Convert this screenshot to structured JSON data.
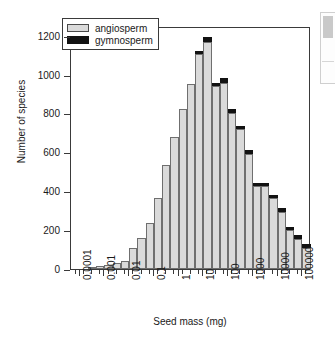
{
  "figure": {
    "background_color": "#ffffff",
    "axis_color": "#3a3a3a"
  },
  "legend": {
    "position": "top-left-inside",
    "entries": [
      {
        "label": "angiosperm",
        "color": "#dadada",
        "swatch": "angiosperm-swatch"
      },
      {
        "label": "gymnosperm",
        "color": "#121212",
        "swatch": "gymnosperm-swatch"
      }
    ]
  },
  "side_panel_fragment": {
    "visible": true
  },
  "chart_data": {
    "type": "bar",
    "subtype": "stacked-histogram",
    "title": "",
    "subtitle": "",
    "xlabel": "Seed mass (mg)",
    "ylabel": "Number of species",
    "xscale": "log",
    "yscale": "linear",
    "ylim": [
      0,
      1250
    ],
    "xlim_log10": [
      -4.35,
      5.35
    ],
    "grid": false,
    "yticks": [
      0,
      200,
      400,
      600,
      800,
      1000,
      1200
    ],
    "ytick_labels": [
      "0",
      "200",
      "400",
      "600",
      "800",
      "1000",
      "1200"
    ],
    "xticks_log10": [
      -4,
      -3,
      -2,
      -1,
      0,
      1,
      2,
      3,
      4,
      5
    ],
    "xtick_labels": [
      "0.0001",
      "0.001",
      "0.01",
      "0.1",
      "1",
      "10",
      "100",
      "1000",
      "10000",
      "100000"
    ],
    "xtick_label_rotation": -90,
    "bin_width_log10": 0.3333,
    "bin_centers_log10": [
      -3.5,
      -3.17,
      -2.83,
      -2.5,
      -2.17,
      -1.83,
      -1.5,
      -1.17,
      -0.83,
      -0.5,
      -0.17,
      0.17,
      0.5,
      0.83,
      1.17,
      1.5,
      1.83,
      2.17,
      2.5,
      2.83,
      3.17,
      3.5,
      3.83,
      4.17,
      4.5,
      4.83,
      5.17
    ],
    "categories": [
      "3e-4",
      "7e-4",
      "1.5e-3",
      "3e-3",
      "7e-3",
      "1.5e-2",
      "3e-2",
      "7e-2",
      "0.15",
      "0.3",
      "0.7",
      "1.5",
      "3",
      "7",
      "15",
      "30",
      "70",
      "150",
      "300",
      "700",
      "1500",
      "3000",
      "7000",
      "15000",
      "30000",
      "70000",
      "150000"
    ],
    "series": [
      {
        "name": "angiosperm",
        "color": "#dadada",
        "values": [
          8,
          14,
          22,
          30,
          42,
          110,
          160,
          235,
          365,
          535,
          680,
          825,
          950,
          1105,
          1170,
          940,
          955,
          805,
          720,
          590,
          425,
          425,
          365,
          295,
          200,
          155,
          110
        ]
      },
      {
        "name": "gymnosperm",
        "color": "#121212",
        "values": [
          0,
          0,
          0,
          0,
          0,
          0,
          0,
          0,
          0,
          0,
          0,
          0,
          0,
          10,
          25,
          10,
          30,
          20,
          15,
          20,
          10,
          10,
          15,
          15,
          10,
          10,
          8
        ]
      }
    ],
    "totals": [
      8,
      14,
      22,
      30,
      42,
      110,
      160,
      235,
      365,
      535,
      680,
      825,
      950,
      1115,
      1195,
      950,
      985,
      825,
      735,
      610,
      435,
      435,
      380,
      310,
      210,
      165,
      118
    ],
    "tail_bars": {
      "right_extra": [
        80,
        68,
        32,
        10,
        4
      ],
      "note": "rightmost declining bars beyond 10000"
    }
  }
}
